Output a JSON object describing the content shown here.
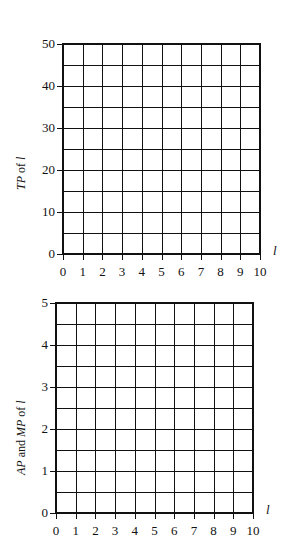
{
  "chart_data": [
    {
      "type": "line",
      "title": "",
      "xlabel": "l",
      "ylabel": "TP of l",
      "ylabel_parts": [
        {
          "text": "TP",
          "italic": true
        },
        {
          "text": " of ",
          "italic": false
        },
        {
          "text": "l",
          "italic": true
        }
      ],
      "x_ticks": [
        "0",
        "1",
        "2",
        "3",
        "4",
        "5",
        "6",
        "7",
        "8",
        "9",
        "10"
      ],
      "y_ticks": [
        "0",
        "10",
        "20",
        "30",
        "40",
        "50"
      ],
      "xlim": [
        0,
        10
      ],
      "ylim": [
        0,
        50
      ],
      "grid": true,
      "grid_x_step": 1,
      "grid_y_step": 5,
      "series": []
    },
    {
      "type": "line",
      "title": "",
      "xlabel": "l",
      "ylabel": "AP and MP of l",
      "ylabel_parts": [
        {
          "text": "AP",
          "italic": true
        },
        {
          "text": " and ",
          "italic": false
        },
        {
          "text": "MP",
          "italic": true
        },
        {
          "text": " of ",
          "italic": false
        },
        {
          "text": "l",
          "italic": true
        }
      ],
      "x_ticks": [
        "0",
        "1",
        "2",
        "3",
        "4",
        "5",
        "6",
        "7",
        "8",
        "9",
        "10"
      ],
      "y_ticks": [
        "0",
        "1",
        "2",
        "3",
        "4",
        "5"
      ],
      "xlim": [
        0,
        10
      ],
      "ylim": [
        0,
        5
      ],
      "grid": true,
      "grid_x_step": 1,
      "grid_y_step": 0.5,
      "series": []
    }
  ],
  "layout": {
    "charts": [
      {
        "left": 62,
        "top": 43,
        "width": 199,
        "height": 212,
        "ytitle_x": 14,
        "ytitle_y": 190
      },
      {
        "left": 55,
        "top": 302,
        "width": 199,
        "height": 212,
        "ytitle_x": 14,
        "ytitle_y": 475
      }
    ]
  }
}
